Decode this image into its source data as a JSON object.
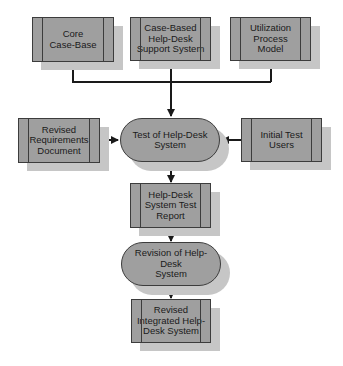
{
  "diagram": {
    "type": "flowchart",
    "colors": {
      "node_fill": "#9f9f9f",
      "shadow": "#c6c6c6",
      "stroke": "#1a1a1a",
      "background": "#ffffff"
    },
    "nodes": {
      "core_case_base": {
        "label": "Core\nCase-Base",
        "shape": "document-box"
      },
      "case_based_support": {
        "label": "Case-Based\nHelp-Desk\nSupport System",
        "shape": "document-box"
      },
      "utilization_model": {
        "label": "Utilization\nProcess\nModel",
        "shape": "document-box"
      },
      "revised_requirements": {
        "label": "Revised\nRequirements\nDocument",
        "shape": "document-box"
      },
      "test_process": {
        "label": "Test of Help-Desk System",
        "shape": "process-oval"
      },
      "initial_test_users": {
        "label": "Initial Test\nUsers",
        "shape": "document-box"
      },
      "test_report": {
        "label": "Help-Desk\nSystem Test\nReport",
        "shape": "document-box"
      },
      "revision_process": {
        "label": "Revision of  Help-Desk\nSystem",
        "shape": "process-oval"
      },
      "revised_system": {
        "label": "Revised\nIntegrated Help-\nDesk System",
        "shape": "document-box"
      }
    },
    "edges": [
      {
        "from": "core_case_base",
        "to": "test_process"
      },
      {
        "from": "case_based_support",
        "to": "test_process"
      },
      {
        "from": "utilization_model",
        "to": "test_process"
      },
      {
        "from": "revised_requirements",
        "to": "test_process"
      },
      {
        "from": "initial_test_users",
        "to": "test_process"
      },
      {
        "from": "test_process",
        "to": "test_report"
      },
      {
        "from": "test_report",
        "to": "revision_process"
      },
      {
        "from": "revision_process",
        "to": "revised_system"
      }
    ]
  }
}
